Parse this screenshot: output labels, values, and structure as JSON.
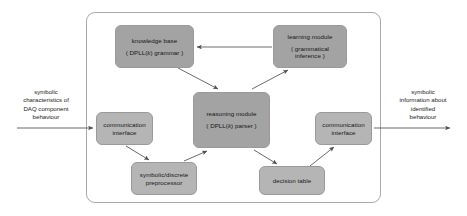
{
  "diagram": {
    "type": "block-diagram",
    "frame": {
      "name": "system-boundary"
    },
    "nodes": [
      {
        "id": "knowledge-base",
        "title": "knowledge base",
        "subtitle_prefix": "( DPLL(",
        "subtitle_italic": "k",
        "subtitle_suffix": ") grammar )",
        "fill": "#a3a3a3"
      },
      {
        "id": "learning-module",
        "title": "learning module",
        "subtitle_line1": "( grammatical",
        "subtitle_line2": "inference )",
        "fill": "#a3a3a3"
      },
      {
        "id": "reasoning-module",
        "title": "reasoning module",
        "subtitle_prefix": "( DPLL(",
        "subtitle_italic": "k",
        "subtitle_suffix": ") parser )",
        "fill": "#a3a3a3"
      },
      {
        "id": "communication-interface-left",
        "title_line1": "communication",
        "title_line2": "interface",
        "fill": "#b5b5b5"
      },
      {
        "id": "communication-interface-right",
        "title_line1": "communication",
        "title_line2": "interface",
        "fill": "#b5b5b5"
      },
      {
        "id": "symbolic-discrete-preprocessor",
        "title_line1": "symbolic/discrete",
        "title_line2": "preprocessor",
        "fill": "#b5b5b5"
      },
      {
        "id": "decision-table",
        "title": "decision table",
        "fill": "#b5b5b5"
      }
    ],
    "edge_labels": {
      "input": {
        "line1": "symbolic",
        "line2": "characteristics of",
        "line3": "DAQ component",
        "line4": "behaviour"
      },
      "output": {
        "line1": "symbolic",
        "line2": "information about",
        "line3": "identified",
        "line4": "behaviour"
      }
    },
    "edges": [
      {
        "from": "learning-module",
        "to": "knowledge-base",
        "style": "arrow"
      },
      {
        "from": "knowledge-base",
        "to": "reasoning-module",
        "style": "arrow"
      },
      {
        "from": "reasoning-module",
        "to": "learning-module",
        "style": "arrow"
      },
      {
        "from": "input-label",
        "to": "communication-interface-left",
        "style": "arrow"
      },
      {
        "from": "communication-interface-left",
        "to": "symbolic-discrete-preprocessor",
        "style": "arrow"
      },
      {
        "from": "symbolic-discrete-preprocessor",
        "to": "reasoning-module",
        "style": "arrow"
      },
      {
        "from": "reasoning-module",
        "to": "decision-table",
        "style": "arrow"
      },
      {
        "from": "decision-table",
        "to": "communication-interface-right",
        "style": "arrow"
      },
      {
        "from": "communication-interface-right",
        "to": "output-label",
        "style": "arrow"
      }
    ],
    "colors": {
      "line": "#5a5a5a",
      "frame": "#a8a8a8",
      "node_dark": "#a3a3a3",
      "node_light": "#b5b5b5",
      "background": "#ffffff"
    }
  }
}
